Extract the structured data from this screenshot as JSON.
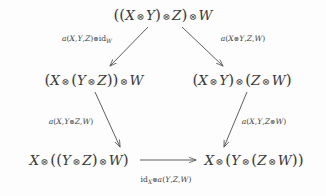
{
  "diagram": {
    "type": "commutative-diagram",
    "background_color": "#fdfdfd",
    "stroke_color": "#555555",
    "text_color": "#3a3a3a",
    "tensor_symbol": "⊗",
    "nodes": [
      {
        "id": "top",
        "text": "((X ⊗ Y) ⊗ Z) ⊗ W",
        "x": 163,
        "y": 15
      },
      {
        "id": "mid-left",
        "text": "(X ⊗ (Y ⊗ Z)) ⊗ W",
        "x": 94,
        "y": 80
      },
      {
        "id": "mid-right",
        "text": "(X ⊗ Y) ⊗ (Z ⊗ W)",
        "x": 242,
        "y": 80
      },
      {
        "id": "bottom-left",
        "text": "X ⊗ ((Y ⊗ Z) ⊗ W)",
        "x": 79,
        "y": 160
      },
      {
        "id": "bottom-right",
        "text": "X ⊗ (Y ⊗ (Z ⊗ W))",
        "x": 254,
        "y": 160
      }
    ],
    "arrows": [
      {
        "id": "top-to-mid-left",
        "from": "top",
        "to": "mid-left",
        "label": "a(X,Y,Z)⊗id_W",
        "label_x": 87,
        "label_y": 39
      },
      {
        "id": "top-to-mid-right",
        "from": "top",
        "to": "mid-right",
        "label": "a(X⊗Y,Z,W)",
        "label_x": 243,
        "label_y": 39
      },
      {
        "id": "mid-left-to-bottom-left",
        "from": "mid-left",
        "to": "bottom-left",
        "label": "a(X,Y⊗Z,W)",
        "label_x": 71,
        "label_y": 122
      },
      {
        "id": "mid-right-to-bottom-right",
        "from": "mid-right",
        "to": "bottom-right",
        "label": "a(X,Y,Z⊗W)",
        "label_x": 264,
        "label_y": 122
      },
      {
        "id": "bottom-left-to-bottom-right",
        "from": "bottom-left",
        "to": "bottom-right",
        "label": "id_X ⊗a(Y,Z,W)",
        "label_x": 166,
        "label_y": 180
      }
    ]
  }
}
